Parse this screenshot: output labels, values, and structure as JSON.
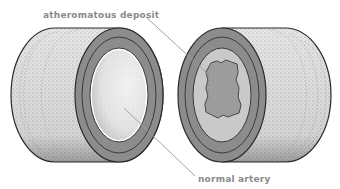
{
  "diagram": {
    "labels": {
      "deposit": "atheromatous deposit",
      "normal": "normal artery"
    },
    "left_artery": {
      "description": "normal artery cross-section",
      "lumen": "clear"
    },
    "right_artery": {
      "description": "artery with atheromatous deposit",
      "lumen": "narrowed by deposit"
    }
  },
  "colors": {
    "background": "#ffffff",
    "wall_gray": "#8c8c8c",
    "wall_dark": "#4a4a4a",
    "lumen_light": "#d8d8d8",
    "deposit": "#7a7a7a",
    "label_text": "#8a8a8a",
    "leader_line": "#9a9a9a",
    "outline": "#2a2a2a"
  }
}
